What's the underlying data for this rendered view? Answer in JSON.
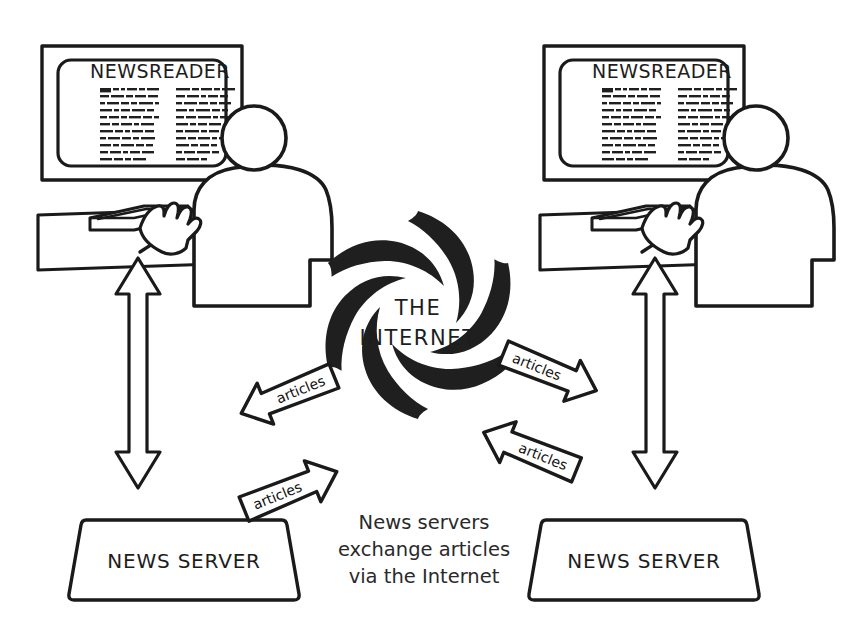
{
  "diagram": {
    "title": "News servers exchange articles via the Internet",
    "background_color": "#ffffff",
    "ink_color": "#1a1a1a"
  },
  "workstations": [
    {
      "side": "left",
      "screen_title": "NEWSREADER",
      "server_label": "NEWS SERVER",
      "link_arrow": "double-headed-vertical-arrow"
    },
    {
      "side": "right",
      "screen_title": "NEWSREADER",
      "server_label": "NEWS SERVER",
      "link_arrow": "double-headed-vertical-arrow"
    }
  ],
  "internet": {
    "line1": "THE",
    "line2": "INTERNET",
    "swirl_arms": 6
  },
  "exchange_arrows": [
    {
      "id": "left-in",
      "label": "articles",
      "direction": "down-left"
    },
    {
      "id": "left-out",
      "label": "articles",
      "direction": "up-right"
    },
    {
      "id": "right-in",
      "label": "articles",
      "direction": "up-left"
    },
    {
      "id": "right-out",
      "label": "articles",
      "direction": "down-right"
    }
  ],
  "caption": {
    "line1": "News servers",
    "line2": "exchange articles",
    "line3": "via the Internet"
  }
}
